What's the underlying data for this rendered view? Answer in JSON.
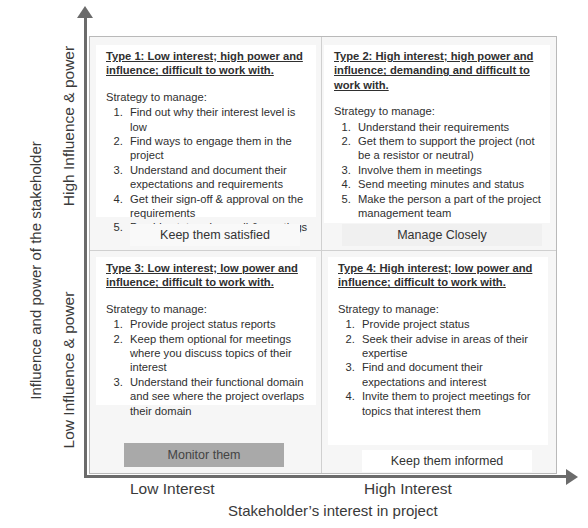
{
  "axes": {
    "y_title": "Influence and power of the stakeholder",
    "y_high": "High Influence & power",
    "y_low": "Low Influence & power",
    "x_title": "Stakeholder’s interest in project",
    "x_low": "Low Interest",
    "x_high": "High Interest"
  },
  "quadrants": [
    {
      "title": "Type 1: Low interest; high power and influence; difficult to work with.",
      "strategy_label": "Strategy to manage:",
      "items": [
        "Find out why their interest level is low",
        "Find ways to engage them in the project",
        "Understand and document their expectations and requirements",
        "Get their sign-off & approval on the requirements",
        "Provide status via email & meetings"
      ],
      "action": "Keep them satisfied"
    },
    {
      "title": "Type 2:  High interest; high power and influence; demanding and difficult to work with.",
      "strategy_label": "Strategy to manage:",
      "items": [
        "Understand their requirements",
        "Get them to support the project (not be a resistor or neutral)",
        "Involve them in meetings",
        "Send meeting minutes and status",
        "Make the person a part of the project management team"
      ],
      "action": "Manage Closely"
    },
    {
      "title": "Type 3:  Low interest; low power and influence; difficult to work with.",
      "strategy_label": "Strategy to manage:",
      "items": [
        "Provide project status reports",
        "Keep them optional for meetings where you discuss topics of their interest",
        "Understand their functional domain and see where the project overlaps their domain"
      ],
      "action": "Monitor them"
    },
    {
      "title": "Type 4:  High interest; low power and influence; difficult to work with.",
      "strategy_label": "Strategy to manage:",
      "items": [
        "Provide project status",
        "Seek their advise in areas of their expertise",
        "Find and document their expectations and interest",
        "Invite them to project meetings for topics that interest them"
      ],
      "action": "Keep them informed"
    }
  ],
  "colors": {
    "axis": "#6b6b6b",
    "monitor_band": "#a9a9a9",
    "grid_border": "#b9b9b9"
  }
}
